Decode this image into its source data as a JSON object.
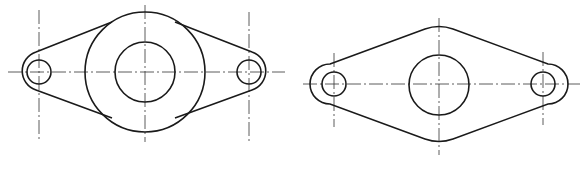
{
  "drawing": {
    "views": [
      {
        "name": "flange-view-with-boss",
        "center": [
          145,
          72
        ],
        "boss_radius": 60,
        "bore_radius": 30,
        "holes": [
          {
            "cx": 39,
            "cy": 72,
            "r": 12,
            "lug_r": 17
          },
          {
            "cx": 249,
            "cy": 72,
            "r": 12,
            "lug_r": 17
          }
        ]
      },
      {
        "name": "flange-view-diamond",
        "center": [
          439,
          85
        ],
        "bore_radius": 30,
        "holes": [
          {
            "cx": 334,
            "cy": 84,
            "r": 12,
            "lug_r": 17
          },
          {
            "cx": 543,
            "cy": 84,
            "r": 12,
            "lug_r": 17
          }
        ]
      }
    ],
    "colors": {
      "line": "#1a1a1a",
      "background": "#ffffff"
    }
  }
}
